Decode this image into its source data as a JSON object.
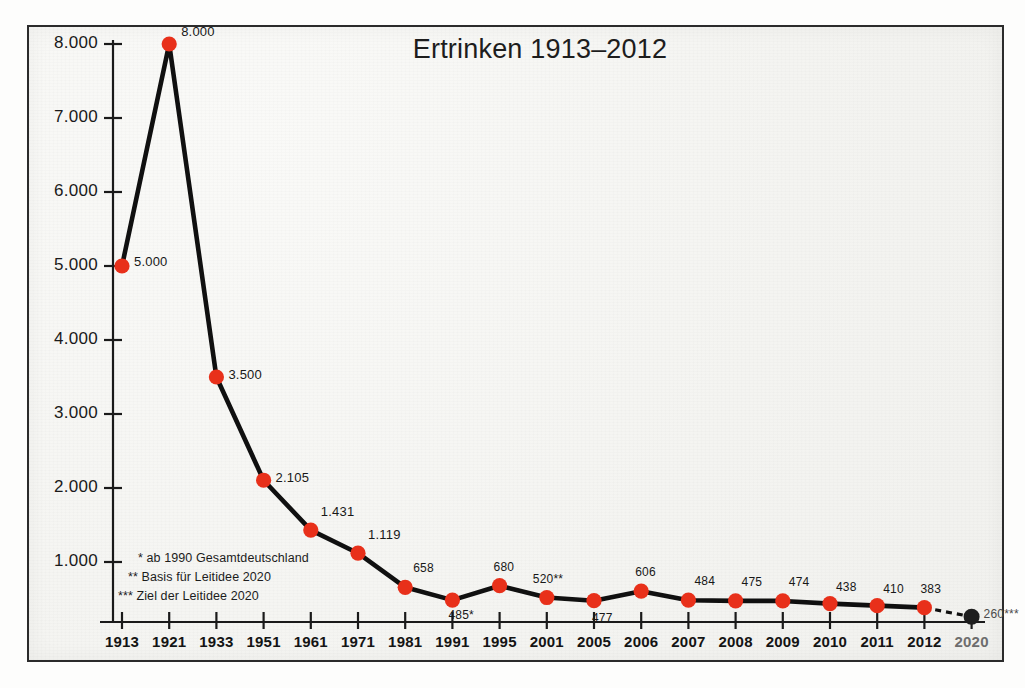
{
  "chart_data": {
    "type": "line",
    "title": "Ertrinken 1913–2012",
    "xlabel": "",
    "ylabel": "",
    "grid": false,
    "legend": "none",
    "ylim": [
      0,
      8000
    ],
    "yticks": [
      "1.000",
      "2.000",
      "3.000",
      "4.000",
      "5.000",
      "6.000",
      "7.000",
      "8.000"
    ],
    "ytick_values": [
      1000,
      2000,
      3000,
      4000,
      5000,
      6000,
      7000,
      8000
    ],
    "categories": [
      "1913",
      "1921",
      "1933",
      "1951",
      "1961",
      "1971",
      "1981",
      "1991",
      "1995",
      "2001",
      "2005",
      "2006",
      "2007",
      "2008",
      "2009",
      "2010",
      "2011",
      "2012",
      "2020"
    ],
    "values": [
      5000,
      8000,
      3500,
      2105,
      1431,
      1119,
      658,
      485,
      680,
      520,
      477,
      606,
      484,
      475,
      474,
      438,
      410,
      383,
      260
    ],
    "point_labels": [
      "5.000",
      "8.000",
      "3.500",
      "2.105",
      "1.431",
      "1.119",
      "658",
      "485*",
      "680",
      "520**",
      "477",
      "606",
      "484",
      "475",
      "474",
      "438",
      "410",
      "383",
      "260***"
    ],
    "series": [
      {
        "name": "Ertrinken",
        "values": [
          5000,
          8000,
          3500,
          2105,
          1431,
          1119,
          658,
          485,
          680,
          520,
          477,
          606,
          484,
          475,
          474,
          438,
          410,
          383,
          260
        ]
      }
    ],
    "projection_point": {
      "category": "2020",
      "value": 260,
      "label": "260***",
      "style": "dashed",
      "marker_color": "#1e1e1e"
    },
    "marker_color": "#e8301a",
    "line_color": "#101010",
    "annotations": [
      "* ab 1990 Gesamtdeutschland",
      "** Basis für Leitidee 2020",
      "*** Ziel der Leitidee 2020"
    ]
  },
  "chart": {
    "title": "Ertrinken 1913–2012",
    "footnotes": [
      "* ab 1990 Gesamtdeutschland",
      "** Basis für Leitidee 2020",
      "*** Ziel der Leitidee 2020"
    ],
    "y_axis": {
      "ticks": [
        "8.000",
        "7.000",
        "6.000",
        "5.000",
        "4.000",
        "3.000",
        "2.000",
        "1.000"
      ]
    },
    "x_axis": {
      "ticks": [
        "1913",
        "1921",
        "1933",
        "1951",
        "1961",
        "1971",
        "1981",
        "1991",
        "1995",
        "2001",
        "2005",
        "2006",
        "2007",
        "2008",
        "2009",
        "2010",
        "2011",
        "2012",
        "2020"
      ]
    },
    "data_labels": [
      "5.000",
      "8.000",
      "3.500",
      "2.105",
      "1.431",
      "1.119",
      "658",
      "485*",
      "680",
      "520**",
      "477",
      "606",
      "484",
      "475",
      "474",
      "438",
      "410",
      "383",
      "260***"
    ],
    "colors": {
      "marker": "#e8301a",
      "line": "#101010",
      "target_marker": "#1e1e1e",
      "paper": "#f3f3f0",
      "frame": "#2b2b2b"
    }
  }
}
